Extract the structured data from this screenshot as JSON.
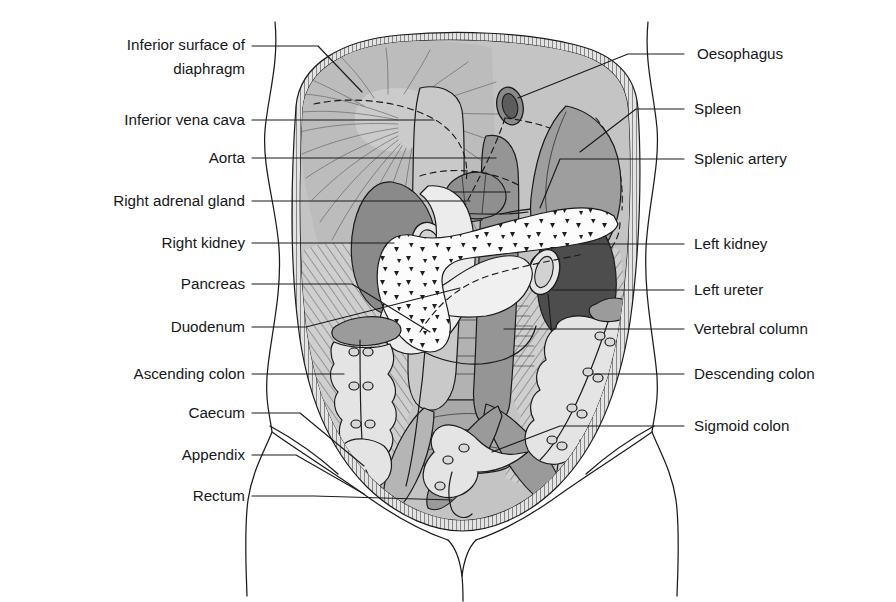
{
  "figure": {
    "view": "Anterior view of the abdomen with anterior abdominal wall and most viscera removed"
  },
  "colors": {
    "ink": "#1b1b1b",
    "text": "#15171a",
    "background": "#ffffff",
    "cavity_wall": "#bdbdbd",
    "diaphragm": "#b9b9b9",
    "peritoneum_rim": "#d8d8d8",
    "kidney_right": "#8a8a8a",
    "kidney_left": "#4d4d4d",
    "spleen": "#9d9d9d",
    "pancreas": "#fdfdfd",
    "duodenum": "#e8e8e8",
    "colon": "#e2e2e2",
    "vessel": "#8f8f8f",
    "muscle_hatch": "#c9c9c9",
    "oesophagus": "#6e6e6e",
    "adrenal": "#8c8c8c",
    "vertebra": "#9a9a9a"
  },
  "labels_left": [
    {
      "id": "inferior-surface-of-diaphragm",
      "line1": "Inferior surface of",
      "line2": "diaphragm",
      "text": "Inferior surface of diaphragm",
      "y": 50
    },
    {
      "id": "inferior-vena-cava",
      "line1": "Inferior vena cava",
      "line2": "",
      "text": "Inferior vena cava",
      "y": 124
    },
    {
      "id": "aorta",
      "line1": "Aorta",
      "line2": "",
      "text": "Aorta",
      "y": 162
    },
    {
      "id": "right-adrenal-gland",
      "line1": "Right adrenal gland",
      "line2": "",
      "text": "Right adrenal gland",
      "y": 205
    },
    {
      "id": "right-kidney",
      "line1": "Right kidney",
      "line2": "",
      "text": "Right kidney",
      "y": 247
    },
    {
      "id": "pancreas",
      "line1": "Pancreas",
      "line2": "",
      "text": "Pancreas",
      "y": 288
    },
    {
      "id": "duodenum",
      "line1": "Duodenum",
      "line2": "",
      "text": "Duodenum",
      "y": 331
    },
    {
      "id": "ascending-colon",
      "line1": "Ascending colon",
      "line2": "",
      "text": "Ascending colon",
      "y": 378
    },
    {
      "id": "caecum",
      "line1": "Caecum",
      "line2": "",
      "text": "Caecum",
      "y": 417
    },
    {
      "id": "appendix",
      "line1": "Appendix",
      "line2": "",
      "text": "Appendix",
      "y": 459
    },
    {
      "id": "rectum",
      "line1": "Rectum",
      "line2": "",
      "text": "Rectum",
      "y": 500
    }
  ],
  "labels_right": [
    {
      "id": "oesophagus",
      "text": "Oesophagus",
      "y": 58
    },
    {
      "id": "spleen",
      "text": "Spleen",
      "y": 113
    },
    {
      "id": "splenic-artery",
      "text": "Splenic artery",
      "y": 163
    },
    {
      "id": "left-kidney",
      "text": "Left kidney",
      "y": 248
    },
    {
      "id": "left-ureter",
      "text": "Left ureter",
      "y": 294
    },
    {
      "id": "vertebral-column",
      "text": "Vertebral column",
      "y": 333
    },
    {
      "id": "descending-colon",
      "text": "Descending colon",
      "y": 378
    },
    {
      "id": "sigmoid-colon",
      "text": "Sigmoid colon",
      "y": 430
    }
  ]
}
